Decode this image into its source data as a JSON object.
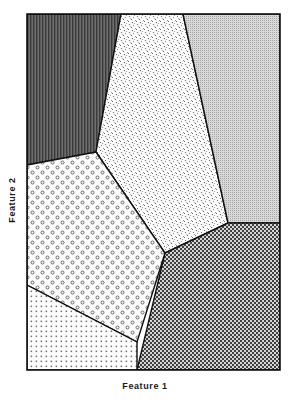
{
  "figure": {
    "type": "voronoi-partition-diagram",
    "title": "",
    "background": "#ffffff",
    "border_color": "#111111",
    "plot_area": {
      "x": 27,
      "y": 14,
      "width": 253,
      "height": 356
    }
  },
  "axes": {
    "x_label": "Feature 1",
    "y_label": "Feature 2",
    "x_ticks": [],
    "y_ticks": [],
    "grid": false
  },
  "chart_data": {
    "type": "diagram",
    "title": "",
    "xlabel": "Feature 1",
    "ylabel": "Feature 2",
    "grid": false,
    "legend": "none",
    "regions": [
      {
        "id": "region-vertical-stripes",
        "name": "upper-left-cell",
        "fill_style": "vertical-stripes",
        "tone": "dark",
        "color": "#4a4a4a",
        "polygon": "27,14 121,14 96,152 27,165"
      },
      {
        "id": "region-speckle",
        "name": "upper-center-cell",
        "fill_style": "fine-speckle",
        "tone": "very-light",
        "color": "#f2f2f2",
        "polygon": "121,14 183,14 228,223 165,253 96,152"
      },
      {
        "id": "region-light-grid",
        "name": "upper-right-cell",
        "fill_style": "light-square-grid",
        "tone": "light-gray",
        "color": "#c9c9c9",
        "polygon": "183,14 280,14 280,223 228,223"
      },
      {
        "id": "region-dark-checker",
        "name": "lower-right-cell",
        "fill_style": "checkerboard-50",
        "tone": "mid-gray",
        "color": "#8a8a8a",
        "polygon": "228,223 280,223 280,370 137,370 165,253"
      },
      {
        "id": "region-circles",
        "name": "mid-left-cell",
        "fill_style": "open-circles",
        "tone": "light",
        "color": "#e8e8e8",
        "polygon": "27,165 96,152 165,253 137,342 27,285"
      },
      {
        "id": "region-dot-grid",
        "name": "lower-left-cell",
        "fill_style": "fine-dot-grid",
        "tone": "very-light",
        "color": "#efefef",
        "polygon": "27,285 137,342 137,370 27,370"
      }
    ],
    "vertices": [
      {
        "name": "triple-junction-upper-left",
        "x": 96,
        "y": 152
      },
      {
        "name": "triple-junction-center",
        "x": 165,
        "y": 253
      },
      {
        "name": "triple-junction-right",
        "x": 228,
        "y": 223
      },
      {
        "name": "boundary-left-upper",
        "x": 27,
        "y": 165
      },
      {
        "name": "boundary-left-lower",
        "x": 27,
        "y": 285
      },
      {
        "name": "boundary-bottom",
        "x": 137,
        "y": 370
      },
      {
        "name": "boundary-top-left",
        "x": 121,
        "y": 14
      },
      {
        "name": "boundary-top-right",
        "x": 183,
        "y": 14
      }
    ]
  }
}
